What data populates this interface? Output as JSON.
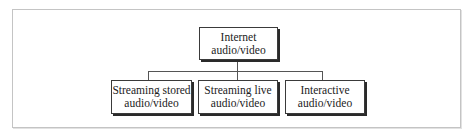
{
  "diagram": {
    "root": {
      "line1": "Internet",
      "line2": "audio/video"
    },
    "children": [
      {
        "line1": "Streaming stored",
        "line2": "audio/video"
      },
      {
        "line1": "Streaming live",
        "line2": "audio/video"
      },
      {
        "line1": "Interactive",
        "line2": "audio/video"
      }
    ]
  }
}
